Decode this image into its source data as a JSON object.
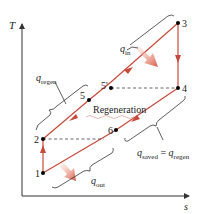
{
  "axes": {
    "y_label": "T",
    "x_label": "s"
  },
  "points": [
    {
      "id": "1",
      "label": "1",
      "x": 43,
      "y": 173
    },
    {
      "id": "2",
      "label": "2",
      "x": 43,
      "y": 139
    },
    {
      "id": "3",
      "label": "3",
      "x": 178,
      "y": 23
    },
    {
      "id": "4",
      "label": "4",
      "x": 178,
      "y": 88
    },
    {
      "id": "5",
      "label": "5",
      "x": 89,
      "y": 100
    },
    {
      "id": "5p",
      "label": "5'",
      "x": 111,
      "y": 88
    },
    {
      "id": "6",
      "label": "6",
      "x": 116,
      "y": 130
    }
  ],
  "labels": {
    "q_in": {
      "main": "q",
      "sub": "in"
    },
    "q_regen": {
      "main": "q",
      "sub": "regen"
    },
    "q_out": {
      "main": "q",
      "sub": "out"
    },
    "q_saved": {
      "main": "q",
      "sub": "saved",
      "eq": " = ",
      "main2": "q",
      "sub2": "regen"
    },
    "regeneration": "Regeneration"
  },
  "colors": {
    "process_line": "#c8493a",
    "axis": "#333333",
    "dashed": "#555555",
    "brace": "#333333",
    "arrow_fill": "#e07a6a",
    "point": "#000000"
  }
}
